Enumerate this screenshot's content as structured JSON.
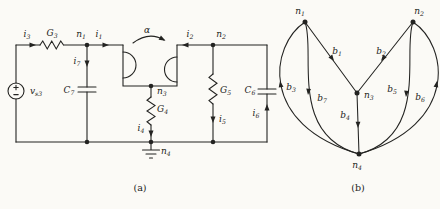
{
  "colors": {
    "ink": "#232321",
    "paper": "#fbfaf6"
  },
  "captions": {
    "a": "(a)",
    "b": "(b)"
  },
  "circuit": {
    "labels": {
      "i3": {
        "t": "i",
        "s": "3"
      },
      "G3": {
        "t": "G",
        "s": "3"
      },
      "n1": {
        "t": "n",
        "s": "1"
      },
      "i1": {
        "t": "i",
        "s": "1"
      },
      "alpha": {
        "t": "α",
        "s": ""
      },
      "i2": {
        "t": "i",
        "s": "2"
      },
      "n2": {
        "t": "n",
        "s": "2"
      },
      "i7": {
        "t": "i",
        "s": "7"
      },
      "C7": {
        "t": "C",
        "s": "7"
      },
      "vs3": {
        "t": "v",
        "s": "s3"
      },
      "n3": {
        "t": "n",
        "s": "3"
      },
      "G4": {
        "t": "G",
        "s": "4"
      },
      "i4": {
        "t": "i",
        "s": "4"
      },
      "G5": {
        "t": "G",
        "s": "5"
      },
      "i5": {
        "t": "i",
        "s": "5"
      },
      "C6": {
        "t": "C",
        "s": "6"
      },
      "i6": {
        "t": "i",
        "s": "6"
      },
      "n4": {
        "t": "n",
        "s": "4"
      }
    }
  },
  "graph": {
    "labels": {
      "n1": {
        "t": "n",
        "s": "1"
      },
      "n2": {
        "t": "n",
        "s": "2"
      },
      "n3": {
        "t": "n",
        "s": "3"
      },
      "n4": {
        "t": "n",
        "s": "4"
      },
      "b1": {
        "t": "b",
        "s": "1"
      },
      "b2": {
        "t": "b",
        "s": "2"
      },
      "b3": {
        "t": "b",
        "s": "3"
      },
      "b4": {
        "t": "b",
        "s": "4"
      },
      "b5": {
        "t": "b",
        "s": "5"
      },
      "b6": {
        "t": "b",
        "s": "6"
      },
      "b7": {
        "t": "b",
        "s": "7"
      }
    },
    "structure": {
      "nodes": [
        "n1",
        "n2",
        "n3",
        "n4"
      ],
      "branches": [
        {
          "id": "b1",
          "from": "n1",
          "to": "n3"
        },
        {
          "id": "b2",
          "from": "n2",
          "to": "n3"
        },
        {
          "id": "b3",
          "from": "n4",
          "to": "n1"
        },
        {
          "id": "b4",
          "from": "n3",
          "to": "n4"
        },
        {
          "id": "b5",
          "from": "n2",
          "to": "n4"
        },
        {
          "id": "b6",
          "from": "n4",
          "to": "n2"
        },
        {
          "id": "b7",
          "from": "n1",
          "to": "n4"
        }
      ]
    }
  }
}
